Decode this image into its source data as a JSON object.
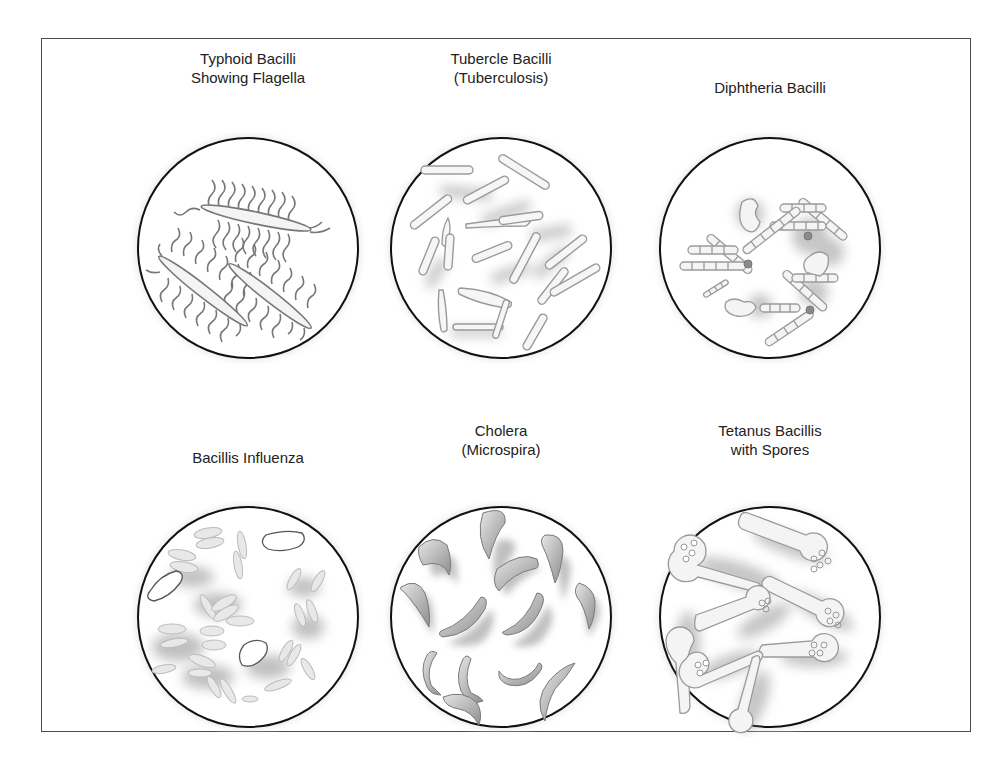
{
  "figure": {
    "panels": [
      {
        "id": "typhoid",
        "label_lines": [
          "Typhoid Bacilli",
          "Showing Flagella"
        ],
        "row": 0,
        "col": 0
      },
      {
        "id": "tubercle",
        "label_lines": [
          "Tubercle Bacilli",
          "(Tuberculosis)"
        ],
        "row": 0,
        "col": 1
      },
      {
        "id": "diphtheria",
        "label_lines": [
          "Diphtheria Bacilli"
        ],
        "row": 0,
        "col": 2
      },
      {
        "id": "influenza",
        "label_lines": [
          "Bacillis Influenza"
        ],
        "row": 1,
        "col": 0
      },
      {
        "id": "cholera",
        "label_lines": [
          "Cholera",
          "(Microspira)"
        ],
        "row": 1,
        "col": 1
      },
      {
        "id": "tetanus",
        "label_lines": [
          "Tetanus Bacillis",
          "with Spores"
        ],
        "row": 1,
        "col": 2
      }
    ],
    "colors": {
      "border": "#4a4a4a",
      "circle_stroke": "#111111",
      "organism_fill": "#f2f2f2",
      "organism_stroke": "#8a8a8a",
      "shadow": "#9a9a9a",
      "cholera_fill": "#a8a8a8"
    }
  }
}
